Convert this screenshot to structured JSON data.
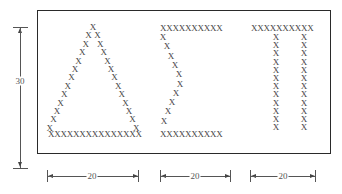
{
  "diagram": {
    "glyph_char": "X",
    "letters": [
      {
        "name": "Delta",
        "symbol": "Δ",
        "base_row": "XXXXXXXXXXXXXXX"
      },
      {
        "name": "Sigma",
        "symbol": "Σ",
        "top_row": "XXXXXXXXXX",
        "bottom_row": "XXXXXXXXXX"
      },
      {
        "name": "Pi",
        "symbol": "Π",
        "top_row": "XXXXXXXXXX"
      }
    ],
    "dimensions": {
      "height_label": "30",
      "width_labels": [
        "20",
        "20",
        "20"
      ]
    }
  }
}
